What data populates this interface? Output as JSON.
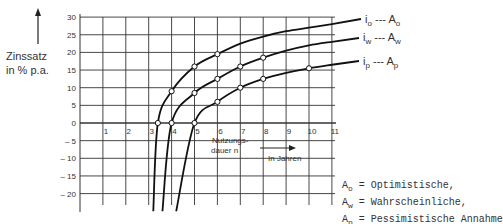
{
  "chart_data": {
    "type": "line",
    "title": "",
    "ylabel": "Zinssatz in % p.a.",
    "xlabel": "Nutzungsdauer n in Jahren",
    "ylim": [
      -25,
      30
    ],
    "xlim": [
      0,
      11
    ],
    "yticks": [
      30,
      25,
      20,
      15,
      10,
      5,
      0,
      -5,
      -10,
      -15,
      -20
    ],
    "ytick_labels": [
      "30",
      "25",
      "20",
      "15",
      "10",
      "5",
      "0",
      "– 5",
      "– 10",
      "– 15",
      "– 20"
    ],
    "xticks": [
      1,
      2,
      3,
      4,
      5,
      6,
      7,
      8,
      9,
      10,
      11
    ],
    "grid": true,
    "series": [
      {
        "name": "i_o --- A_o",
        "label": "io",
        "sub": "o",
        "legend_right": "Ao",
        "points": [
          [
            3.2,
            -25
          ],
          [
            3.4,
            0
          ],
          [
            4,
            9
          ],
          [
            5,
            16
          ],
          [
            6,
            19.5
          ],
          [
            7,
            22.5
          ],
          [
            8,
            24.5
          ],
          [
            9,
            26
          ],
          [
            10,
            27
          ],
          [
            11,
            28
          ]
        ],
        "markers": [
          [
            3.4,
            0
          ],
          [
            4,
            9
          ],
          [
            5,
            16
          ],
          [
            6,
            19.5
          ]
        ]
      },
      {
        "name": "i_w --- A_w",
        "label": "iw",
        "sub": "w",
        "legend_right": "Aw",
        "points": [
          [
            3.6,
            -25
          ],
          [
            4,
            0
          ],
          [
            5,
            8.5
          ],
          [
            6,
            12.5
          ],
          [
            7,
            16
          ],
          [
            8,
            18.5
          ],
          [
            9,
            20.5
          ],
          [
            10,
            22
          ],
          [
            11,
            23
          ]
        ],
        "markers": [
          [
            4,
            0
          ],
          [
            5,
            8.5
          ],
          [
            6,
            12.5
          ],
          [
            7,
            16
          ],
          [
            8,
            18.5
          ]
        ]
      },
      {
        "name": "i_p --- A_p",
        "label": "ip",
        "sub": "p",
        "legend_right": "Ap",
        "points": [
          [
            4.2,
            -25
          ],
          [
            5,
            0
          ],
          [
            6,
            6
          ],
          [
            7,
            10
          ],
          [
            8,
            12.5
          ],
          [
            9,
            14.2
          ],
          [
            10,
            15.5
          ],
          [
            11,
            16.5
          ]
        ],
        "markers": [
          [
            5,
            0
          ],
          [
            6,
            6
          ],
          [
            7,
            10
          ],
          [
            8,
            12.5
          ],
          [
            10,
            15.5
          ]
        ]
      }
    ],
    "annotations": [
      "Nutzungs-dauer n",
      "In Jahren"
    ]
  },
  "axis": {
    "ylabel_line1": "Zinssatz",
    "ylabel_line2": "in % p.a.",
    "xlabel_line1": "Nutzungs-",
    "xlabel_line2": "dauer n",
    "xunit": "In Jahren"
  },
  "legend": [
    {
      "i": "i",
      "sub": "o",
      "dash": "---",
      "A": "A",
      "Asub": "o"
    },
    {
      "i": "i",
      "sub": "w",
      "dash": "---",
      "A": "A",
      "Asub": "w"
    },
    {
      "i": "i",
      "sub": "p",
      "dash": "---",
      "A": "A",
      "Asub": "p"
    }
  ],
  "notes": [
    {
      "sym": "A",
      "sub": "o",
      "text": " = Optimistische,"
    },
    {
      "sym": "A",
      "sub": "w",
      "text": " = Wahrscheinliche,"
    },
    {
      "sym": "A",
      "sub": "p",
      "text": " = Pessimistische Annahme"
    }
  ]
}
